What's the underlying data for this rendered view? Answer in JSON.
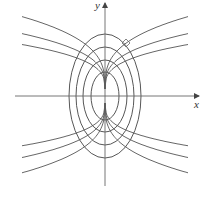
{
  "figure": {
    "type": "diagram",
    "colors": {
      "background": "#ffffff",
      "ellipse": "#444444",
      "curve": "#555555",
      "axis": "#666666",
      "label": "#333333"
    },
    "axes": {
      "x_label": "x",
      "y_label": "y",
      "origin_px": [
        105,
        96
      ],
      "x_axis_px": {
        "from": 15,
        "to": 199
      },
      "y_axis_px": {
        "from": 186,
        "to": 3
      }
    },
    "ellipses": [
      {
        "rx": 14,
        "ry": 24
      },
      {
        "rx": 22,
        "ry": 36
      },
      {
        "rx": 29,
        "ry": 49
      },
      {
        "rx": 36,
        "ry": 62
      }
    ],
    "trajectories": {
      "formula": "y = k * cbrt(x)",
      "x_extent_px": 83,
      "upper": {
        "apex_y_px": 89,
        "k_values": [
          10.2,
          12.7,
          16.6
        ]
      },
      "lower": {
        "apex_y_px": 103,
        "k_values": [
          9.8,
          12.5,
          16.0
        ]
      }
    },
    "right_angle_marker": {
      "points_px": [
        [
          122,
          43
        ],
        [
          126,
          39
        ],
        [
          130,
          43
        ],
        [
          126,
          47
        ]
      ]
    }
  }
}
